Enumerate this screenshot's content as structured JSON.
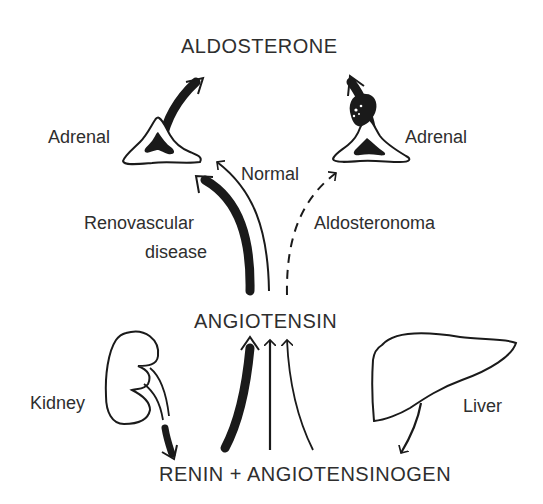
{
  "diagram": {
    "nodes": {
      "aldosterone": "ALDOSTERONE",
      "adrenal_left": "Adrenal",
      "adrenal_right": "Adrenal",
      "angiotensin": "ANGIOTENSIN",
      "kidney": "Kidney",
      "liver": "Liver",
      "renin_plus_angiotensinogen": "RENIN + ANGIOTENSINOGEN"
    },
    "pathways": {
      "renovascular_line1": "Renovascular",
      "renovascular_line2": "disease",
      "normal": "Normal",
      "aldosteronoma": "Aldosteronoma"
    },
    "edges": [
      {
        "from": "Kidney",
        "to": "RENIN",
        "style": "thick"
      },
      {
        "from": "Liver",
        "to": "ANGIOTENSINOGEN",
        "style": "thin"
      },
      {
        "from": "RENIN + ANGIOTENSINOGEN",
        "to": "ANGIOTENSIN",
        "style": "thick",
        "condition": "Renovascular disease"
      },
      {
        "from": "RENIN + ANGIOTENSINOGEN",
        "to": "ANGIOTENSIN",
        "style": "thin",
        "condition": "Normal"
      },
      {
        "from": "RENIN + ANGIOTENSINOGEN",
        "to": "ANGIOTENSIN",
        "style": "thin",
        "condition": "Aldosteronoma"
      },
      {
        "from": "ANGIOTENSIN",
        "to": "Adrenal (left)",
        "style": "thick",
        "condition": "Renovascular disease"
      },
      {
        "from": "ANGIOTENSIN",
        "to": "Adrenal (left)",
        "style": "thin",
        "condition": "Normal"
      },
      {
        "from": "ANGIOTENSIN",
        "to": "Adrenal (right)",
        "style": "dashed",
        "condition": "Aldosteronoma"
      },
      {
        "from": "Adrenal (left)",
        "to": "ALDOSTERONE",
        "style": "thick"
      },
      {
        "from": "Adrenal (right)",
        "to": "ALDOSTERONE",
        "style": "thick"
      }
    ],
    "colors": {
      "ink": "#1a1a1a",
      "background": "#ffffff"
    }
  }
}
